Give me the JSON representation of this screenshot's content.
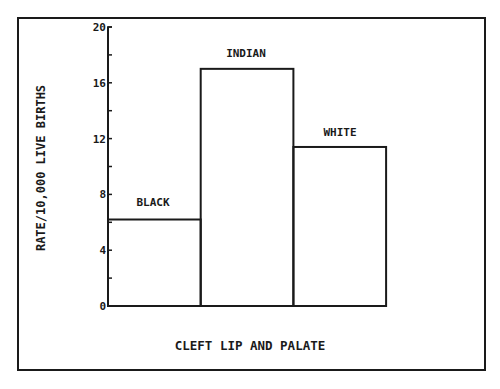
{
  "chart_data": {
    "type": "bar",
    "title": "",
    "categories": [
      "BLACK",
      "INDIAN",
      "WHITE"
    ],
    "values": [
      6.2,
      17.0,
      11.4
    ],
    "xlabel": "CLEFT LIP AND PALATE",
    "ylabel": "RATE/10,000 LIVE BIRTHS",
    "ylim": [
      0,
      20
    ],
    "yticks": [
      0,
      4,
      8,
      12,
      16,
      20
    ],
    "minor_ytick_step": 2,
    "grid": false,
    "legend": null,
    "bar_style": "outlined, no fill, adjacent bars",
    "labels_position": "above bars"
  },
  "labels": {
    "ylabel": "RATE/10,000 LIVE BIRTHS",
    "xlabel": "CLEFT LIP AND PALATE",
    "bars": [
      "BLACK",
      "INDIAN",
      "WHITE"
    ],
    "yticks": [
      "0",
      "4",
      "8",
      "12",
      "16",
      "20"
    ]
  },
  "colors": {
    "ink": "#1a1a1a",
    "background": "#ffffff"
  }
}
